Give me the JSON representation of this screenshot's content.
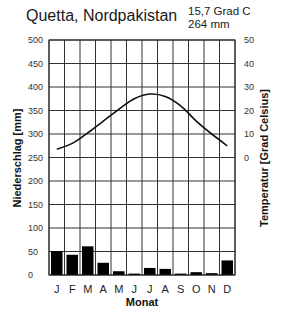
{
  "header": {
    "title": "Quetta, Nordpakistan",
    "annual_temp": "15,7 Grad C",
    "annual_precip": "264 mm"
  },
  "chart_data": {
    "type": "bar+line",
    "title": "Quetta, Nordpakistan",
    "subtitle": [
      "15,7 Grad C",
      "264 mm"
    ],
    "categories": [
      "J",
      "F",
      "M",
      "A",
      "M",
      "J",
      "J",
      "A",
      "S",
      "O",
      "N",
      "D"
    ],
    "xlabel": "Monat",
    "ylabel_left": "Niederschlag [mm]",
    "ylabel_right": "Temperatur [Grad Celsius]",
    "ylim_left": [
      0,
      500
    ],
    "ylim_right": [
      -25,
      50
    ],
    "left_ticks": [
      0,
      50,
      100,
      150,
      200,
      250,
      300,
      350,
      400,
      450,
      500
    ],
    "right_ticks": [
      0,
      10,
      20,
      30,
      40,
      50
    ],
    "grid": true,
    "series": [
      {
        "name": "Niederschlag",
        "type": "bar",
        "axis": "left",
        "color": "#000000",
        "values": [
          51,
          43,
          61,
          26,
          8,
          3,
          15,
          13,
          3,
          6,
          4,
          31
        ]
      },
      {
        "name": "Temperatur",
        "type": "line",
        "axis": "right",
        "color": "#000000",
        "values": [
          3.5,
          6,
          10.5,
          15.5,
          20.5,
          25,
          27,
          26,
          22,
          15.5,
          10,
          5
        ]
      }
    ]
  }
}
